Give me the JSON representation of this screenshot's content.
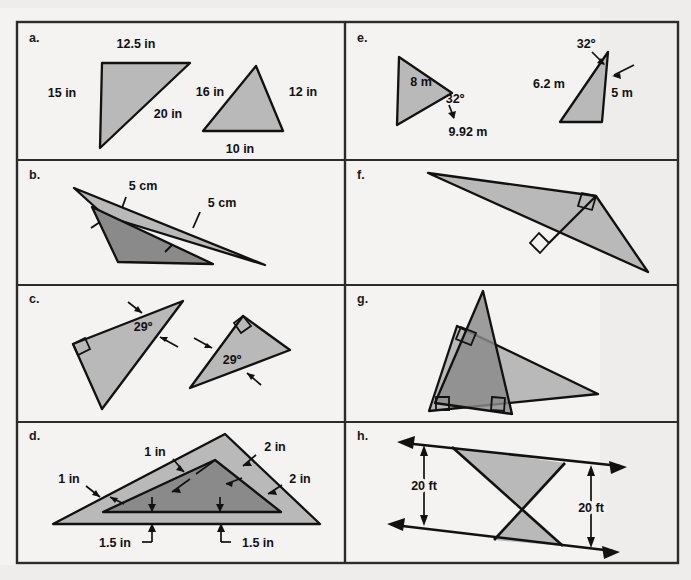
{
  "sheet": {
    "width": 691,
    "height": 580,
    "background_color": "#f4f3f1",
    "border_color": "#2b2b2b",
    "frame": {
      "x": 17,
      "y": 22,
      "width": 661,
      "height": 541
    },
    "column_divider_x": 345,
    "row_divider_y": [
      160,
      285,
      422
    ],
    "caption": ""
  },
  "style": {
    "fill_light": "#b9b9b9",
    "fill_medium": "#a7a7a7",
    "fill_dark": "#8a8a8a",
    "stroke": "#111111",
    "text_color": "#111111"
  },
  "panels": [
    {
      "id": "a",
      "letter": "a.",
      "letter_pos": {
        "x": 29,
        "y": 42
      },
      "description": "Two similar right triangles with side lengths in inches",
      "labels": [
        {
          "name": "label-12-5-in",
          "text": "12.5 in",
          "x": 136,
          "y": 48,
          "anchor": "middle"
        },
        {
          "name": "label-15-in",
          "text": "15 in",
          "x": 62,
          "y": 92,
          "anchor": "middle"
        },
        {
          "name": "label-20-in",
          "text": "20 in",
          "x": 168,
          "y": 116,
          "anchor": "middle"
        },
        {
          "name": "label-16-in",
          "text": "16 in",
          "x": 212,
          "y": 93,
          "anchor": "middle"
        },
        {
          "name": "label-12-in",
          "text": "12 in",
          "x": 290,
          "y": 93,
          "anchor": "middle"
        },
        {
          "name": "label-10-in",
          "text": "10 in",
          "x": 237,
          "y": 153,
          "anchor": "middle"
        }
      ],
      "shapes": [
        {
          "name": "triangle-large-a",
          "points": "102,63 190,63 100,148",
          "fill": "#b9b9b9"
        },
        {
          "name": "triangle-small-a",
          "points": "256,66 283,131 203,131",
          "fill": "#b9b9b9"
        }
      ]
    },
    {
      "id": "b",
      "letter": "b.",
      "letter_pos": {
        "x": 29,
        "y": 179
      },
      "description": "Two overlapping similar obtuse triangles, each labelled 5 cm with tick marks",
      "labels": [
        {
          "name": "label-5-cm-outer",
          "text": "5 cm",
          "x": 143,
          "y": 188,
          "anchor": "middle"
        },
        {
          "name": "label-5-cm-inner",
          "text": "5 cm",
          "x": 215,
          "y": 205,
          "anchor": "middle"
        }
      ],
      "shapes": [
        {
          "name": "triangle-light-b",
          "points": "74,188 265,265 105,215",
          "fill": "#b9b9b9"
        },
        {
          "name": "triangle-dark-b",
          "points": "91,205 215,265 119,262",
          "fill": "#8a8a8a"
        }
      ]
    },
    {
      "id": "c",
      "letter": "c.",
      "letter_pos": {
        "x": 29,
        "y": 303
      },
      "description": "Two rotated similar right triangles each with a 29 degree angle marked",
      "labels": [
        {
          "name": "label-29-deg-left",
          "text": "29º",
          "x": 143,
          "y": 328,
          "anchor": "middle"
        },
        {
          "name": "label-29-deg-right",
          "text": "29º",
          "x": 232,
          "y": 362,
          "anchor": "middle"
        }
      ],
      "shapes": [
        {
          "name": "triangle-left-c",
          "points": "73,344 183,301 102,409",
          "fill": "#b9b9b9"
        },
        {
          "name": "triangle-right-c",
          "points": "243,316 290,350 190,388",
          "fill": "#b9b9b9"
        }
      ]
    },
    {
      "id": "d",
      "letter": "d.",
      "letter_pos": {
        "x": 29,
        "y": 440
      },
      "description": "Nested similar triangles with tick marks; outer labelled 1 in and 2 in, base offsets 1.5 in",
      "labels": [
        {
          "name": "label-1-in-top",
          "text": "1 in",
          "x": 155,
          "y": 455,
          "anchor": "middle"
        },
        {
          "name": "label-2-in-top",
          "text": "2 in",
          "x": 265,
          "y": 450,
          "anchor": "middle"
        },
        {
          "name": "label-1-in-left",
          "text": "1 in",
          "x": 72,
          "y": 482,
          "anchor": "middle"
        },
        {
          "name": "label-2-in-right",
          "text": "2 in",
          "x": 295,
          "y": 481,
          "anchor": "middle"
        },
        {
          "name": "label-1-5-in-left",
          "text": "1.5 in",
          "x": 122,
          "y": 548,
          "anchor": "middle"
        },
        {
          "name": "label-1-5-in-right",
          "text": "1.5 in",
          "x": 249,
          "y": 548,
          "anchor": "middle"
        }
      ],
      "shapes": [
        {
          "name": "triangle-outer-d",
          "points": "225,434 320,524 53,524",
          "fill": "#b9b9b9"
        },
        {
          "name": "triangle-inner-d",
          "points": "215,457 280,512 105,512",
          "fill": "#8a8a8a"
        }
      ]
    },
    {
      "id": "e",
      "letter": "e.",
      "letter_pos": {
        "x": 357,
        "y": 42
      },
      "description": "Two similar triangles with metric side lengths and 32 degree angles",
      "labels": [
        {
          "name": "label-8-m",
          "text": "8 m",
          "x": 424,
          "y": 84,
          "anchor": "middle"
        },
        {
          "name": "label-32-deg-left",
          "text": "32º",
          "x": 455,
          "y": 101,
          "anchor": "middle"
        },
        {
          "name": "label-9-92-m",
          "text": "9.92 m",
          "x": 466,
          "y": 133,
          "anchor": "middle"
        },
        {
          "name": "label-32-deg-right",
          "text": "32º",
          "x": 587,
          "y": 47,
          "anchor": "middle"
        },
        {
          "name": "label-6-2-m",
          "text": "6.2 m",
          "x": 551,
          "y": 86,
          "anchor": "middle"
        },
        {
          "name": "label-5-m",
          "text": "5 m",
          "x": 619,
          "y": 95,
          "anchor": "middle"
        }
      ],
      "shapes": [
        {
          "name": "triangle-left-e",
          "points": "399,58 451,93 397,124",
          "fill": "#b9b9b9"
        },
        {
          "name": "triangle-right-e",
          "points": "607,52 601,122 560,122",
          "fill": "#b9b9b9"
        }
      ]
    },
    {
      "id": "f",
      "letter": "f.",
      "letter_pos": {
        "x": 357,
        "y": 179
      },
      "description": "Right triangle subdivided by an altitude into two similar right triangles",
      "labels": [],
      "shapes": [
        {
          "name": "triangle-outer-f",
          "points": "428,174 596,195 648,271",
          "fill": "#b9b9b9"
        }
      ]
    },
    {
      "id": "g",
      "letter": "g.",
      "letter_pos": {
        "x": 357,
        "y": 303
      },
      "description": "Two overlapping right triangles sharing a region, right angles marked",
      "labels": [],
      "shapes": [
        {
          "name": "triangle-wide-g",
          "points": "457,326 598,394 429,411",
          "fill": "#b9b9b9"
        },
        {
          "name": "triangle-tall-g",
          "points": "483,291 511,413 435,402",
          "fill": "#8a8a8a"
        }
      ]
    },
    {
      "id": "h",
      "letter": "h.",
      "letter_pos": {
        "x": 357,
        "y": 440
      },
      "description": "Two transversal lines forming vertical similar triangles, both labelled 20 ft",
      "labels": [
        {
          "name": "label-20-ft-left",
          "text": "20 ft",
          "x": 422,
          "y": 487,
          "anchor": "middle"
        },
        {
          "name": "label-20-ft-right",
          "text": "20 ft",
          "x": 590,
          "y": 509,
          "anchor": "middle"
        }
      ],
      "shapes": [
        {
          "name": "triangle-upper-h",
          "points": "452,447 565,463 524,509",
          "fill": "#b9b9b9"
        },
        {
          "name": "triangle-lower-h",
          "points": "524,509 563,546 494,540",
          "fill": "#b9b9b9"
        }
      ]
    }
  ]
}
